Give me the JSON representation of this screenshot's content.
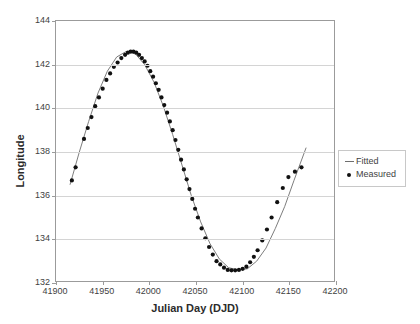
{
  "chart_data": {
    "type": "scatter",
    "title": "",
    "xlabel": "Julian Day (DJD)",
    "ylabel": "Longitude",
    "xlim": [
      41900,
      42200
    ],
    "ylim": [
      132,
      144
    ],
    "xticks": [
      41900,
      41950,
      42000,
      42050,
      42100,
      42150,
      42200
    ],
    "yticks": [
      132,
      134,
      136,
      138,
      140,
      142,
      144
    ],
    "grid": "horizontal",
    "legend_position": "right-outside",
    "series": [
      {
        "name": "Fitted",
        "marker": "line",
        "color": "#6e6e6e",
        "x": [
          41915,
          41925,
          41935,
          41945,
          41955,
          41965,
          41975,
          41985,
          41995,
          42005,
          42015,
          42025,
          42035,
          42045,
          42055,
          42065,
          42075,
          42085,
          42095,
          42105,
          42115,
          42125,
          42135,
          42145,
          42155,
          42168
        ],
        "y": [
          136.5,
          138.0,
          139.4,
          140.7,
          141.7,
          142.35,
          142.6,
          142.5,
          142.0,
          141.2,
          140.1,
          138.8,
          137.4,
          136.0,
          134.8,
          133.8,
          133.1,
          132.7,
          132.6,
          132.65,
          133.0,
          133.6,
          134.5,
          135.5,
          136.7,
          138.2
        ]
      },
      {
        "name": "Measured",
        "marker": "dot",
        "color": "#111111",
        "x": [
          41917,
          41921,
          41930,
          41934,
          41938,
          41942,
          41946,
          41950,
          41954,
          41958,
          41962,
          41966,
          41970,
          41974,
          41977,
          41980,
          41983,
          41986,
          41989,
          41992,
          41995,
          41998,
          42001,
          42004,
          42007,
          42010,
          42013,
          42016,
          42019,
          42022,
          42025,
          42028,
          42031,
          42034,
          42037,
          42040,
          42043,
          42046,
          42049,
          42052,
          42056,
          42060,
          42064,
          42068,
          42072,
          42076,
          42080,
          42084,
          42088,
          42092,
          42096,
          42100,
          42104,
          42108,
          42112,
          42116,
          42121,
          42126,
          42131,
          42137,
          42143,
          42149,
          42156,
          42163
        ],
        "y": [
          136.7,
          137.3,
          138.6,
          139.1,
          139.6,
          140.1,
          140.5,
          140.9,
          141.3,
          141.6,
          141.9,
          142.1,
          142.3,
          142.45,
          142.55,
          142.6,
          142.6,
          142.55,
          142.45,
          142.3,
          142.15,
          141.95,
          141.7,
          141.45,
          141.15,
          140.85,
          140.5,
          140.15,
          139.8,
          139.4,
          139.0,
          138.55,
          138.1,
          137.65,
          137.2,
          136.75,
          136.3,
          135.85,
          135.4,
          135.0,
          134.5,
          134.05,
          133.65,
          133.3,
          133.0,
          132.85,
          132.7,
          132.6,
          132.58,
          132.58,
          132.6,
          132.65,
          132.75,
          132.95,
          133.2,
          133.5,
          133.95,
          134.45,
          135.0,
          135.7,
          136.35,
          136.85,
          137.1,
          137.3
        ]
      }
    ]
  },
  "legend": {
    "entries": [
      {
        "label": "Fitted",
        "marker": "line"
      },
      {
        "label": "Measured",
        "marker": "dot"
      }
    ]
  }
}
